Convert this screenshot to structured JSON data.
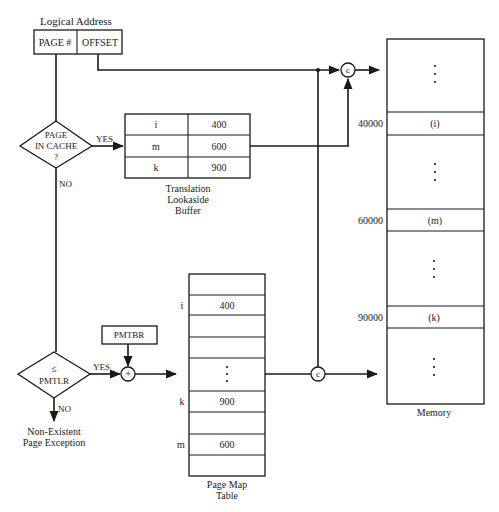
{
  "logical_address": {
    "title": "Logical Address",
    "page_field": "PAGE #",
    "offset_field": "OFFSET"
  },
  "decision_cache": {
    "line1": "PAGE",
    "line2": "IN CACHE",
    "line3": "?",
    "yes_label": "YES",
    "no_label": "NO"
  },
  "tlb": {
    "caption_line1": "Translation",
    "caption_line2": "Lookaside",
    "caption_line3": "Buffer",
    "rows": [
      {
        "page": "i",
        "frame": "400"
      },
      {
        "page": "m",
        "frame": "600"
      },
      {
        "page": "k",
        "frame": "900"
      }
    ]
  },
  "decision_pmtlr": {
    "symbol": "≤",
    "label": "PMTLR",
    "yes_label": "YES",
    "no_label": "NO",
    "exception_line1": "Non-Existent",
    "exception_line2": "Page Exception"
  },
  "pmtbr": {
    "label": "PMTBR"
  },
  "adder": {
    "symbol": "+"
  },
  "concat": {
    "symbol": "c"
  },
  "page_map_table": {
    "caption_line1": "Page Map",
    "caption_line2": "Table",
    "row_labels": {
      "i": "i",
      "k": "k",
      "m": "m"
    },
    "values": {
      "i": "400",
      "k": "900",
      "m": "600"
    }
  },
  "memory": {
    "caption": "Memory",
    "blocks": [
      {
        "address": "40000",
        "label": "(i)"
      },
      {
        "address": "60000",
        "label": "(m)"
      },
      {
        "address": "90000",
        "label": "(k)"
      }
    ]
  }
}
